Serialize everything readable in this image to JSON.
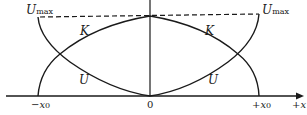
{
  "figure": {
    "labels": {
      "umax_left": "U",
      "umax_left_sub": "max",
      "umax_right": "U",
      "umax_right_sub": "max",
      "kinetic_left": "K",
      "kinetic_right": "K",
      "potential_left": "U",
      "potential_right": "U"
    },
    "ticks": {
      "neg_x0_sign": "−",
      "neg_x0_var": "x",
      "neg_x0_sub": "0",
      "zero": "0",
      "pos_x0_sign": "+",
      "pos_x0_var": "x",
      "pos_x0_sub": "0",
      "axis_sign": "+",
      "axis_var": "x"
    },
    "colors": {
      "stroke": "#1a1a1a",
      "background": "#ffffff"
    }
  }
}
